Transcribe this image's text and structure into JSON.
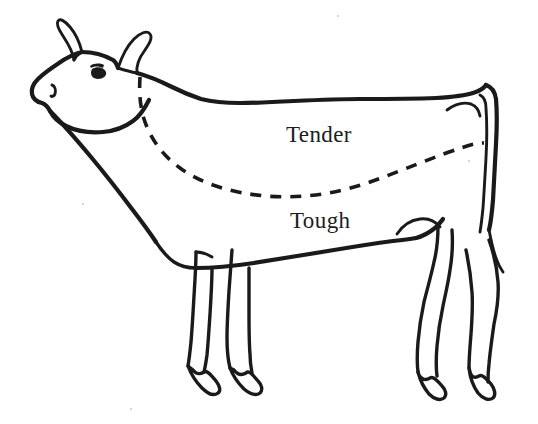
{
  "figure": {
    "orientation": "facing-left",
    "background_color": "#ffffff",
    "ink_color": "#1a1a1a",
    "labels": [
      {
        "id": "tender",
        "text": "Tender",
        "region": "upper body above dashed dividing line",
        "x": 286,
        "y": 122
      },
      {
        "id": "tough",
        "text": "Tough",
        "region": "lower body below dashed dividing line",
        "x": 290,
        "y": 208
      }
    ],
    "divider": {
      "style": "dashed",
      "description": "curved dashed line from base of horn sweeping down across the shoulder and belly up to the tail",
      "color": "#1a1a1a"
    },
    "anatomy": [
      "horn-left",
      "horn-right",
      "eye",
      "nostril",
      "muzzle",
      "neck",
      "back",
      "tail",
      "udder-line",
      "front-leg-near",
      "front-leg-far",
      "hind-leg-near",
      "hind-leg-far",
      "hoof-front-near",
      "hoof-front-far",
      "hoof-hind-near",
      "hoof-hind-far"
    ]
  }
}
